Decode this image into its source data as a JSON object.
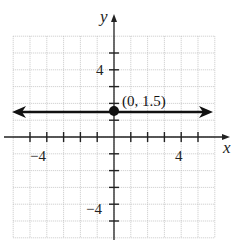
{
  "chart_data": {
    "type": "line",
    "title": "",
    "xlabel": "x",
    "ylabel": "y",
    "xlim": [
      -6,
      6
    ],
    "ylim": [
      -6,
      6
    ],
    "grid": true,
    "x_tick_labels": [
      "−4",
      "4"
    ],
    "y_tick_labels": [
      "4",
      "−4"
    ],
    "series": [
      {
        "name": "y = 1.5",
        "x": [
          -6,
          6
        ],
        "y": [
          1.5,
          1.5
        ],
        "arrows": "both"
      }
    ],
    "points": [
      {
        "x": 0,
        "y": 1.5,
        "label": "(0, 1.5)"
      }
    ],
    "annotations": [
      "(0, 1.5)"
    ]
  },
  "labels": {
    "x_axis": "x",
    "y_axis": "y",
    "x_neg4": "−4",
    "x_pos4": "4",
    "y_pos4": "4",
    "y_neg4": "−4",
    "point": "(0, 1.5)"
  }
}
